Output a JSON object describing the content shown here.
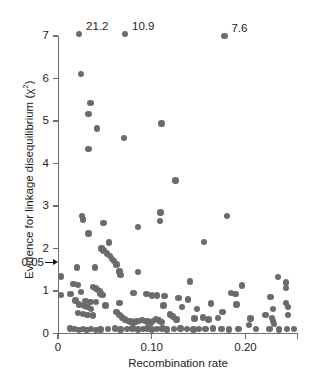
{
  "chart_data": {
    "type": "scatter",
    "title": "",
    "xlabel": "Recombination rate",
    "ylabel": "Evidence for linkage disequilibrium (χ²)",
    "xlim": [
      0,
      0.2565
    ],
    "ylim": [
      0,
      7.2
    ],
    "grid": false,
    "legend": null,
    "xticks": [
      0,
      0.1,
      0.2
    ],
    "xticklabels": [
      "0",
      "0.10",
      "0.20"
    ],
    "yticks": [
      0,
      1,
      2,
      3,
      4,
      5,
      6,
      7
    ],
    "yticklabels": [
      "0",
      "1",
      "2",
      "3",
      "4",
      "5",
      "6",
      "7"
    ],
    "threshold": {
      "label": "0.05",
      "value": 1.67,
      "marker": "arrow"
    },
    "annotations": [
      {
        "text": "21.2",
        "x": 0.0225,
        "y": 7.05
      },
      {
        "text": "10.9",
        "x": 0.0715,
        "y": 7.05
      },
      {
        "text": "7.6",
        "x": 0.1775,
        "y": 7.0
      }
    ],
    "point_color": "#6b6b6b",
    "point_size": 6.4,
    "points": [
      {
        "x": 0.0225,
        "y": 7.05
      },
      {
        "x": 0.0715,
        "y": 7.05
      },
      {
        "x": 0.1775,
        "y": 7.0
      },
      {
        "x": 0.0245,
        "y": 6.1
      },
      {
        "x": 0.0345,
        "y": 5.42
      },
      {
        "x": 0.0325,
        "y": 5.16
      },
      {
        "x": 0.1105,
        "y": 4.94
      },
      {
        "x": 0.0415,
        "y": 4.82
      },
      {
        "x": 0.0705,
        "y": 4.6
      },
      {
        "x": 0.0325,
        "y": 4.34
      },
      {
        "x": 0.1255,
        "y": 3.6
      },
      {
        "x": 0.1095,
        "y": 2.85
      },
      {
        "x": 0.0255,
        "y": 2.76
      },
      {
        "x": 0.1805,
        "y": 2.76
      },
      {
        "x": 0.0265,
        "y": 2.68
      },
      {
        "x": 0.1085,
        "y": 2.64
      },
      {
        "x": 0.0485,
        "y": 2.6
      },
      {
        "x": 0.0855,
        "y": 2.5
      },
      {
        "x": 0.0325,
        "y": 2.35
      },
      {
        "x": 0.1555,
        "y": 2.16
      },
      {
        "x": 0.0545,
        "y": 2.14
      },
      {
        "x": 0.0465,
        "y": 2.0
      },
      {
        "x": 0.0485,
        "y": 1.95
      },
      {
        "x": 0.0525,
        "y": 1.88
      },
      {
        "x": 0.0555,
        "y": 1.82
      },
      {
        "x": 0.0575,
        "y": 1.76
      },
      {
        "x": 0.0595,
        "y": 1.7
      },
      {
        "x": 0.0625,
        "y": 1.62
      },
      {
        "x": 0.0205,
        "y": 1.55
      },
      {
        "x": 0.0395,
        "y": 1.55
      },
      {
        "x": 0.0655,
        "y": 1.46
      },
      {
        "x": 0.0855,
        "y": 1.44
      },
      {
        "x": 0.0665,
        "y": 1.38
      },
      {
        "x": 0.0035,
        "y": 1.34
      },
      {
        "x": 0.2345,
        "y": 1.33
      },
      {
        "x": 0.1405,
        "y": 1.22
      },
      {
        "x": 0.2435,
        "y": 1.2
      },
      {
        "x": 0.0165,
        "y": 1.17
      },
      {
        "x": 0.0215,
        "y": 1.14
      },
      {
        "x": 0.1965,
        "y": 1.13
      },
      {
        "x": 0.0375,
        "y": 1.1
      },
      {
        "x": 0.0405,
        "y": 1.06
      },
      {
        "x": 0.0425,
        "y": 1.02
      },
      {
        "x": 0.0445,
        "y": 0.99
      },
      {
        "x": 0.0245,
        "y": 0.98
      },
      {
        "x": 0.0455,
        "y": 0.94
      },
      {
        "x": 0.0475,
        "y": 0.9
      },
      {
        "x": 0.0135,
        "y": 0.93
      },
      {
        "x": 0.0035,
        "y": 0.9
      },
      {
        "x": 0.0805,
        "y": 0.96
      },
      {
        "x": 0.0945,
        "y": 0.93
      },
      {
        "x": 0.1005,
        "y": 0.89
      },
      {
        "x": 0.1055,
        "y": 0.89
      },
      {
        "x": 0.1135,
        "y": 0.88
      },
      {
        "x": 0.1285,
        "y": 0.84
      },
      {
        "x": 0.1845,
        "y": 0.95
      },
      {
        "x": 0.1895,
        "y": 0.93
      },
      {
        "x": 0.2265,
        "y": 0.86
      },
      {
        "x": 0.2435,
        "y": 1.07
      },
      {
        "x": 0.1385,
        "y": 0.8
      },
      {
        "x": 0.0185,
        "y": 0.78
      },
      {
        "x": 0.0295,
        "y": 0.76
      },
      {
        "x": 0.0345,
        "y": 0.74
      },
      {
        "x": 0.0405,
        "y": 0.74
      },
      {
        "x": 0.0225,
        "y": 0.68
      },
      {
        "x": 0.0275,
        "y": 0.66
      },
      {
        "x": 0.0315,
        "y": 0.62
      },
      {
        "x": 0.0355,
        "y": 0.58
      },
      {
        "x": 0.0505,
        "y": 0.66
      },
      {
        "x": 0.0655,
        "y": 0.72
      },
      {
        "x": 0.1635,
        "y": 0.71
      },
      {
        "x": 0.1905,
        "y": 0.68
      },
      {
        "x": 0.2435,
        "y": 0.72
      },
      {
        "x": 0.2455,
        "y": 0.62
      },
      {
        "x": 0.1125,
        "y": 0.66
      },
      {
        "x": 0.1325,
        "y": 0.62
      },
      {
        "x": 0.1485,
        "y": 0.58
      },
      {
        "x": 0.2295,
        "y": 0.58
      },
      {
        "x": 0.1755,
        "y": 0.5
      },
      {
        "x": 0.0215,
        "y": 0.48
      },
      {
        "x": 0.0265,
        "y": 0.46
      },
      {
        "x": 0.0315,
        "y": 0.44
      },
      {
        "x": 0.0375,
        "y": 0.42
      },
      {
        "x": 0.0625,
        "y": 0.5
      },
      {
        "x": 0.0655,
        "y": 0.44
      },
      {
        "x": 0.0685,
        "y": 0.38
      },
      {
        "x": 0.0715,
        "y": 0.33
      },
      {
        "x": 0.0745,
        "y": 0.3
      },
      {
        "x": 0.0775,
        "y": 0.28
      },
      {
        "x": 0.0805,
        "y": 0.26
      },
      {
        "x": 0.0835,
        "y": 0.28
      },
      {
        "x": 0.0865,
        "y": 0.3
      },
      {
        "x": 0.0895,
        "y": 0.32
      },
      {
        "x": 0.0925,
        "y": 0.3
      },
      {
        "x": 0.0955,
        "y": 0.28
      },
      {
        "x": 0.0985,
        "y": 0.26
      },
      {
        "x": 0.1015,
        "y": 0.3
      },
      {
        "x": 0.1045,
        "y": 0.34
      },
      {
        "x": 0.1075,
        "y": 0.31
      },
      {
        "x": 0.1105,
        "y": 0.27
      },
      {
        "x": 0.1195,
        "y": 0.45
      },
      {
        "x": 0.1225,
        "y": 0.4
      },
      {
        "x": 0.1265,
        "y": 0.33
      },
      {
        "x": 0.1455,
        "y": 0.35
      },
      {
        "x": 0.1545,
        "y": 0.38
      },
      {
        "x": 0.1605,
        "y": 0.33
      },
      {
        "x": 0.1705,
        "y": 0.36
      },
      {
        "x": 0.2055,
        "y": 0.35
      },
      {
        "x": 0.2215,
        "y": 0.44
      },
      {
        "x": 0.2285,
        "y": 0.36
      },
      {
        "x": 0.2295,
        "y": 0.3
      },
      {
        "x": 0.2305,
        "y": 0.22
      },
      {
        "x": 0.2455,
        "y": 0.44
      },
      {
        "x": 0.0125,
        "y": 0.12
      },
      {
        "x": 0.0175,
        "y": 0.1
      },
      {
        "x": 0.0225,
        "y": 0.08
      },
      {
        "x": 0.0265,
        "y": 0.1
      },
      {
        "x": 0.0305,
        "y": 0.08
      },
      {
        "x": 0.0355,
        "y": 0.1
      },
      {
        "x": 0.0405,
        "y": 0.08
      },
      {
        "x": 0.0455,
        "y": 0.09
      },
      {
        "x": 0.0535,
        "y": 0.1
      },
      {
        "x": 0.0605,
        "y": 0.12
      },
      {
        "x": 0.0665,
        "y": 0.09
      },
      {
        "x": 0.0735,
        "y": 0.1
      },
      {
        "x": 0.0795,
        "y": 0.12
      },
      {
        "x": 0.0855,
        "y": 0.09
      },
      {
        "x": 0.0905,
        "y": 0.1
      },
      {
        "x": 0.0955,
        "y": 0.12
      },
      {
        "x": 0.1005,
        "y": 0.09
      },
      {
        "x": 0.1055,
        "y": 0.1
      },
      {
        "x": 0.1115,
        "y": 0.12
      },
      {
        "x": 0.1165,
        "y": 0.09
      },
      {
        "x": 0.1235,
        "y": 0.1
      },
      {
        "x": 0.1305,
        "y": 0.12
      },
      {
        "x": 0.1375,
        "y": 0.1
      },
      {
        "x": 0.1445,
        "y": 0.09
      },
      {
        "x": 0.1505,
        "y": 0.11
      },
      {
        "x": 0.1575,
        "y": 0.1
      },
      {
        "x": 0.1655,
        "y": 0.12
      },
      {
        "x": 0.1745,
        "y": 0.1
      },
      {
        "x": 0.1825,
        "y": 0.09
      },
      {
        "x": 0.1925,
        "y": 0.11
      },
      {
        "x": 0.2035,
        "y": 0.2
      },
      {
        "x": 0.2115,
        "y": 0.1
      },
      {
        "x": 0.2255,
        "y": 0.1
      },
      {
        "x": 0.2355,
        "y": 0.09
      },
      {
        "x": 0.2445,
        "y": 0.11
      },
      {
        "x": 0.2515,
        "y": 0.1
      }
    ]
  }
}
